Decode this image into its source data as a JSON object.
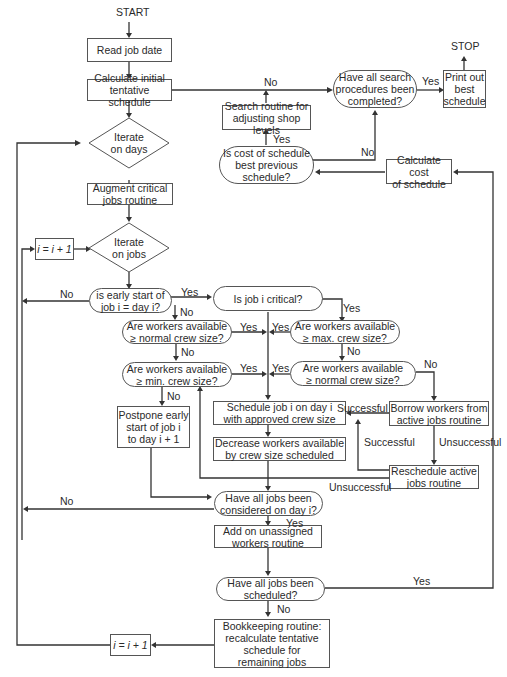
{
  "terminals": {
    "start": "START",
    "stop": "STOP"
  },
  "nodes": {
    "read_job": "Read job date",
    "calc_initial": "Calculate initial\ntentative schedule",
    "iterate_days": "Iterate\non days",
    "augment": "Augment critical\njobs routine",
    "i_inc_top": "i = i + 1",
    "iterate_jobs": "Iterate\non jobs",
    "early_start": "is early start of\njob i = day i?",
    "job_critical": "Is job i critical?",
    "normal_left": "Are workers available\n≥ normal crew size?",
    "max_crew": "Are workers available\n≥ max. crew size?",
    "min_crew": "Are workers available\n≥ min. crew size?",
    "normal_right": "Are workers available\n≥ normal crew size?",
    "schedule_job": "Schedule job i on day i\nwith approved crew size",
    "borrow": "Borrow workers from\nactive jobs routine",
    "decrease": "Decrease workers available\nby crew size scheduled",
    "postpone": "Postpone early\nstart of job i\nto day i + 1",
    "reschedule": "Reschedule active\njobs routine",
    "all_considered": "Have all jobs been\nconsidered on day i?",
    "add_unassigned": "Add on unassigned\nworkers routine",
    "all_scheduled": "Have all jobs been\nscheduled?",
    "bookkeeping": "Bookkeeping routine:\nrecalculate tentative\nschedule for\nremaining jobs",
    "i_inc_bottom": "i = i + 1",
    "search_complete": "Have all search\nprocedures been\ncompleted?",
    "print_best": "Print out\nbest\nschedule",
    "search_routine": "Search routine for\nadjusting shop levels",
    "cost_best": "Is cost of schedule\nbest previous\nschedule?",
    "calc_cost": "Calculate cost\nof schedule"
  },
  "edge_labels": {
    "no_search": "No",
    "yes_print": "Yes",
    "yes_search_routine": "Yes",
    "no_cost": "No",
    "no_early": "No",
    "yes_early": "Yes",
    "no_early_down": "No",
    "yes_critical": "Yes",
    "yes_normal_left": "Yes",
    "yes_max": "Yes",
    "no_normal_left": "No",
    "no_max": "No",
    "yes_min": "Yes",
    "yes_normal_right": "Yes",
    "no_normal_right": "No",
    "no_min": "No",
    "successful_borrow": "Successful",
    "successful_reschedule": "Successful",
    "unsuccessful_borrow": "Unsuccessful",
    "unsuccessful_reschedule": "Unsuccessful",
    "no_considered": "No",
    "yes_considered": "Yes",
    "yes_scheduled": "Yes",
    "no_scheduled": "No"
  }
}
